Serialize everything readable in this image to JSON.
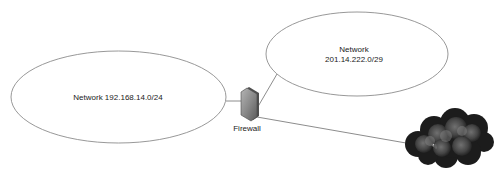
{
  "diagram": {
    "title": "",
    "nodes": [
      {
        "id": "lan",
        "type": "network-ellipse",
        "label_lines": [
          "Network 192.168.14.0/24"
        ]
      },
      {
        "id": "dmz",
        "type": "network-ellipse",
        "label_lines": [
          "Network",
          "201.14.222.0/29"
        ]
      },
      {
        "id": "firewall",
        "type": "firewall",
        "label": "Firewall"
      },
      {
        "id": "internet",
        "type": "cloud",
        "label": ""
      }
    ],
    "edges": [
      {
        "from": "lan",
        "to": "firewall"
      },
      {
        "from": "firewall",
        "to": "dmz"
      },
      {
        "from": "firewall",
        "to": "internet"
      }
    ],
    "colors": {
      "outline": "#8c8c8c",
      "line": "#6e6e6e",
      "firewall_fill": "#8a8a8a",
      "cloud_dark": "#1e1e1e",
      "cloud_light": "#6a6a6a"
    }
  }
}
